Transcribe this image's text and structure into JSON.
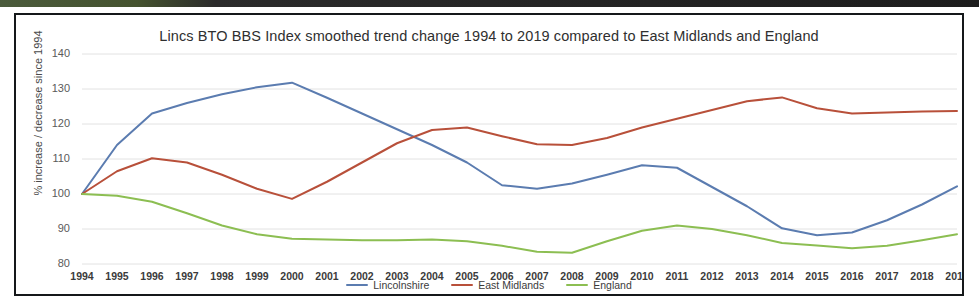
{
  "chart_data": {
    "type": "line",
    "title": "Lincs BTO BBS Index smoothed trend change 1994 to 2019 compared to East Midlands and England",
    "xlabel": "",
    "ylabel": "% increase / decrease since 1994",
    "xlim": [
      1994,
      2019
    ],
    "ylim": [
      80,
      140
    ],
    "yticks": [
      80,
      90,
      100,
      110,
      120,
      130,
      140
    ],
    "grid": true,
    "legend_position": "bottom",
    "categories": [
      "1994",
      "1995",
      "1996",
      "1997",
      "1998",
      "1999",
      "2000",
      "2001",
      "2002",
      "2003",
      "2004",
      "2005",
      "2006",
      "2007",
      "2008",
      "2009",
      "2010",
      "2011",
      "2012",
      "2013",
      "2014",
      "2015",
      "2016",
      "2017",
      "2018",
      "2019"
    ],
    "series": [
      {
        "name": "Lincolnshire",
        "color": "#5b7cb0",
        "values": [
          100,
          114,
          123,
          126,
          128.5,
          130.5,
          131.8,
          127.5,
          123,
          118.5,
          114,
          109,
          102.5,
          101.5,
          103,
          105.5,
          108.2,
          107.5,
          102,
          96.5,
          90.2,
          88.2,
          89,
          92.5,
          97,
          102.2
        ]
      },
      {
        "name": "East Midlands",
        "color": "#b8503a",
        "values": [
          100,
          106.5,
          110.2,
          109,
          105.5,
          101.5,
          98.6,
          103.5,
          109,
          114.5,
          118.3,
          119,
          116.5,
          114.2,
          114,
          116,
          119,
          121.5,
          124,
          126.5,
          127.6,
          124.5,
          123,
          123.3,
          123.6,
          123.7
        ]
      },
      {
        "name": "England",
        "color": "#8cbe52",
        "values": [
          100,
          99.5,
          97.8,
          94.5,
          91,
          88.5,
          87.2,
          87,
          86.8,
          86.8,
          87,
          86.5,
          85.2,
          83.5,
          83.2,
          86.5,
          89.5,
          91,
          90,
          88.2,
          86,
          85.3,
          84.5,
          85.2,
          86.8,
          88.5
        ]
      }
    ]
  },
  "legend": {
    "items": [
      {
        "label": "Lincolnshire",
        "color": "#5b7cb0"
      },
      {
        "label": "East Midlands",
        "color": "#b8503a"
      },
      {
        "label": "England",
        "color": "#8cbe52"
      }
    ]
  }
}
